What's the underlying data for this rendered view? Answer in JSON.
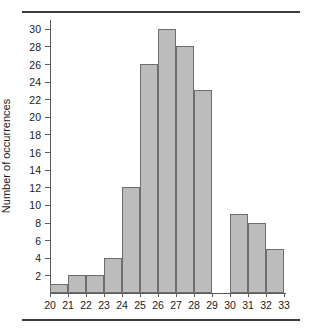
{
  "chart_data": {
    "type": "bar",
    "title": "",
    "subtitle": "",
    "xlabel": "",
    "ylabel": "Number of occurrences",
    "categories": [
      "20-21",
      "21-22",
      "22-23",
      "23-24",
      "24-25",
      "25-26",
      "26-27",
      "27-28",
      "28-29",
      "29-30",
      "30-31",
      "31-32",
      "32-33"
    ],
    "bin_edges": [
      20,
      21,
      22,
      23,
      24,
      25,
      26,
      27,
      28,
      29,
      30,
      31,
      32,
      33
    ],
    "values": [
      1,
      2,
      2,
      4,
      12,
      26,
      30,
      28,
      23,
      0,
      9,
      8,
      5
    ],
    "xtick_labels": [
      "20",
      "21",
      "22",
      "23",
      "24",
      "25",
      "26",
      "27",
      "28",
      "29",
      "30",
      "31",
      "32",
      "33"
    ],
    "ytick_labels": [
      "2",
      "4",
      "6",
      "8",
      "10",
      "12",
      "14",
      "16",
      "18",
      "20",
      "22",
      "24",
      "26",
      "28",
      "30"
    ],
    "ytick_values": [
      2,
      4,
      6,
      8,
      10,
      12,
      14,
      16,
      18,
      20,
      22,
      24,
      26,
      28,
      30
    ],
    "xlim": [
      20,
      33
    ],
    "ylim": [
      0,
      31
    ],
    "grid": false,
    "legend": null,
    "bar_fill_color": "#bcbcbc",
    "bar_border_color": "#6e6e6e",
    "axis_color": "#5a5a5a",
    "rule_color": "#3c3c3c"
  }
}
